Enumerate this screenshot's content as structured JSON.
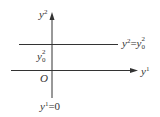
{
  "diagram": {
    "vertical_axis": {
      "symbol": "y",
      "index": "2"
    },
    "horizontal_axis": {
      "symbol": "y",
      "index": "1"
    },
    "origin_label": "O",
    "level_line": {
      "lhs_symbol": "y",
      "lhs_index": "2",
      "equals": "=",
      "rhs_symbol": "y",
      "rhs_sup": "2",
      "rhs_sub": "0"
    },
    "intercept_label": {
      "symbol": "y",
      "sup": "2",
      "sub": "0"
    },
    "axis_equation": {
      "symbol": "y",
      "index": "1",
      "equals": "=",
      "value": "0"
    },
    "colors": {
      "line": "#333333",
      "text": "#333333",
      "background": "#ffffff"
    }
  }
}
